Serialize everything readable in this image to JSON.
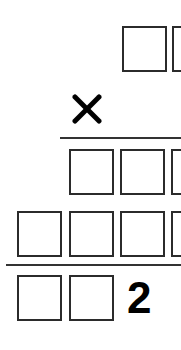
{
  "puzzle": {
    "title": "",
    "operator": "×",
    "operator_icon": "multiply-icon",
    "rows": [
      {
        "name": "multiplicand",
        "cells": [
          "",
          ""
        ]
      },
      {
        "name": "partial-product-1",
        "cells": [
          "",
          "",
          ""
        ]
      },
      {
        "name": "partial-product-2",
        "cells": [
          "",
          "",
          "",
          ""
        ]
      },
      {
        "name": "result",
        "cells": [
          "",
          "",
          "2"
        ]
      }
    ],
    "given_digit": "2",
    "colors": {
      "ink": "#000000",
      "box_border": "#2b2b2b",
      "rule": "#333333",
      "background": "#ffffff"
    }
  }
}
